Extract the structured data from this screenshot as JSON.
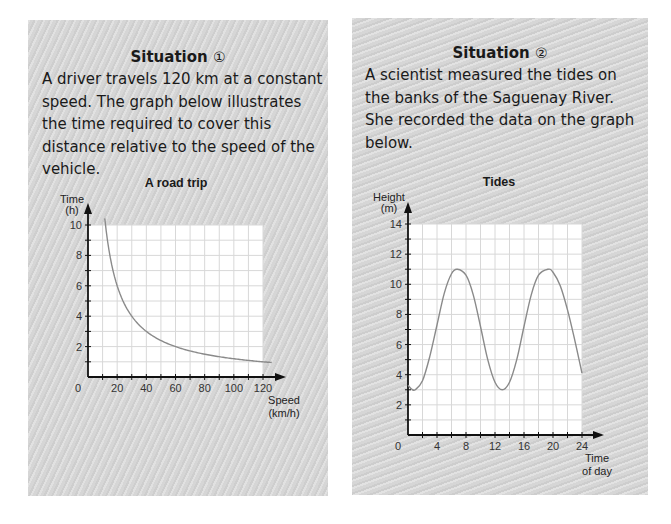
{
  "situations": [
    {
      "title": "Situation",
      "number_glyph": "①",
      "description": "A driver travels 120 km at a constant speed. The graph below illustrates the time required to cover this distance relative to the speed of the vehicle."
    },
    {
      "title": "Situation",
      "number_glyph": "②",
      "description": "A scientist measured the tides on the banks of the Saguenay River. She recorded the data on the graph below."
    }
  ],
  "colors": {
    "panel_bg": "#d6d6d6",
    "grid_bg": "#ffffff",
    "grid_line": "#d8d8d8",
    "axis": "#111111",
    "curve": "#8a8a8a"
  },
  "chart_data": [
    {
      "type": "line",
      "title": "A road trip",
      "xlabel": "Speed (km/h)",
      "xlabel_lines": [
        "Speed",
        "(km/h)"
      ],
      "ylabel": "Time (h)",
      "ylabel_lines": [
        "Time",
        "(h)"
      ],
      "xlim": [
        0,
        120
      ],
      "ylim": [
        0,
        10
      ],
      "x_ticks": [
        20,
        40,
        60,
        80,
        100,
        120
      ],
      "y_ticks": [
        2,
        4,
        6,
        8,
        10
      ],
      "origin_label": "0",
      "grid": true,
      "x_grid_step": 10,
      "y_grid_step": 1,
      "series": [
        {
          "name": "Time to travel 120 km",
          "function": "t = 120 / v",
          "x": [
            11.5,
            12,
            15,
            20,
            25,
            30,
            40,
            50,
            60,
            70,
            80,
            90,
            100,
            110,
            120,
            126
          ],
          "y": [
            10.43,
            10,
            8,
            6,
            4.8,
            4,
            3,
            2.4,
            2,
            1.71,
            1.5,
            1.33,
            1.2,
            1.09,
            1,
            0.95
          ]
        }
      ]
    },
    {
      "type": "line",
      "title": "Tides",
      "xlabel": "Time of day",
      "xlabel_lines": [
        "Time",
        "of day"
      ],
      "ylabel": "Height (m)",
      "ylabel_lines": [
        "Height",
        "(m)"
      ],
      "xlim": [
        0,
        24
      ],
      "ylim": [
        0,
        14
      ],
      "x_ticks": [
        4,
        8,
        12,
        16,
        20,
        24
      ],
      "y_ticks": [
        2,
        4,
        6,
        8,
        10,
        12,
        14
      ],
      "origin_label": "0",
      "grid": true,
      "x_grid_step": 2,
      "y_grid_step": 1,
      "series": [
        {
          "name": "Tide height",
          "x": [
            0,
            0.5,
            1,
            2,
            3,
            4,
            5,
            6,
            6.8,
            8,
            9,
            10,
            11,
            12,
            13,
            14,
            15,
            16,
            17,
            18,
            19.3,
            20,
            21,
            22,
            23,
            24
          ],
          "y": [
            3.3,
            3.05,
            3.0,
            3.6,
            5.2,
            7.3,
            9.4,
            10.7,
            11.0,
            10.6,
            9.3,
            7.2,
            5.0,
            3.5,
            3.0,
            3.5,
            5.0,
            7.2,
            9.3,
            10.6,
            11.0,
            10.8,
            9.9,
            8.3,
            6.3,
            4.1
          ]
        }
      ]
    }
  ]
}
